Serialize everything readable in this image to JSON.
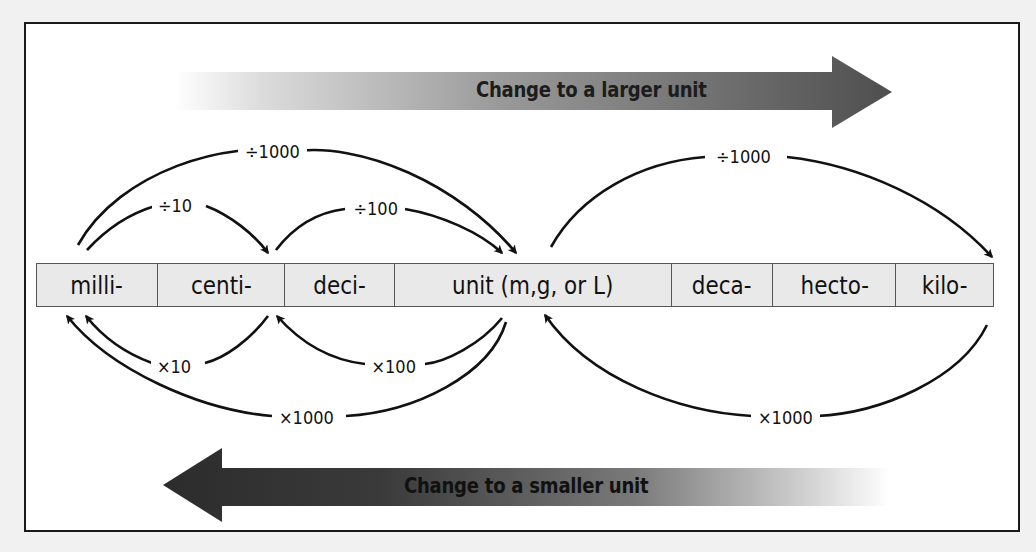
{
  "diagram": {
    "type": "metric-prefix-conversion",
    "larger_arrow": {
      "label": "Change to a larger unit",
      "direction": "right",
      "color": "#5a5a5a"
    },
    "smaller_arrow": {
      "label": "Change to a smaller unit",
      "direction": "left",
      "color": "#3a3a3a"
    },
    "prefixes": [
      {
        "id": "milli",
        "label": "milli-",
        "width": 121
      },
      {
        "id": "centi",
        "label": "centi-",
        "width": 128
      },
      {
        "id": "deci",
        "label": "deci-",
        "width": 110
      },
      {
        "id": "unit",
        "label": "unit (m,g, or L)",
        "width": 277
      },
      {
        "id": "deca",
        "label": "deca-",
        "width": 102
      },
      {
        "id": "hecto",
        "label": "hecto-",
        "width": 123
      },
      {
        "id": "kilo",
        "label": "kilo-",
        "width": 97
      }
    ],
    "conversions_up": [
      {
        "from": "milli",
        "to": "centi",
        "label": "÷10"
      },
      {
        "from": "centi",
        "to": "unit",
        "label": "÷100"
      },
      {
        "from": "milli",
        "to": "unit",
        "label": "÷1000"
      },
      {
        "from": "unit",
        "to": "kilo",
        "label": "÷1000"
      }
    ],
    "conversions_down": [
      {
        "from": "centi",
        "to": "milli",
        "label": "×10"
      },
      {
        "from": "unit",
        "to": "centi",
        "label": "×100"
      },
      {
        "from": "unit",
        "to": "milli",
        "label": "×1000"
      },
      {
        "from": "kilo",
        "to": "unit",
        "label": "×1000"
      }
    ]
  }
}
